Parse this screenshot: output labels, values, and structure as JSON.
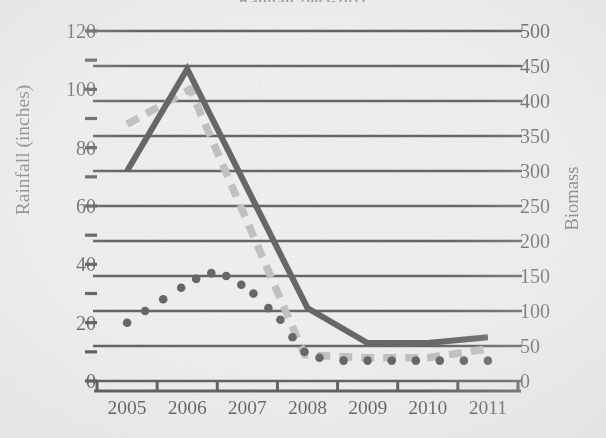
{
  "chart_data": {
    "type": "line",
    "title": "Rainfall 2005-2011",
    "title_visible_fragment": "Rainfall 2005-2011",
    "xlabel": "",
    "ylabel": "Rainfall (inches)",
    "y2label": "Biomass",
    "categories": [
      "2005",
      "2006",
      "2007",
      "2008",
      "2009",
      "2010",
      "2011"
    ],
    "ylim": [
      0,
      120
    ],
    "yticks": [
      "0",
      "20",
      "40",
      "60",
      "80",
      "100",
      "120"
    ],
    "ytick_values": [
      0,
      20,
      40,
      60,
      80,
      100,
      120
    ],
    "y2lim": [
      0,
      500
    ],
    "y2ticks": [
      "0",
      "50",
      "100",
      "150",
      "200",
      "250",
      "300",
      "350",
      "400",
      "450",
      "500"
    ],
    "y2tick_values": [
      0,
      50,
      100,
      150,
      200,
      250,
      300,
      350,
      400,
      450,
      500
    ],
    "grid": true,
    "grid_orientation": "horizontal",
    "legend": "none",
    "series": [
      {
        "name": "solid-black-line",
        "style": "solid",
        "color": "#1a1a1a",
        "axis": "left",
        "values": [
          72,
          107,
          66,
          25,
          13,
          13,
          15
        ]
      },
      {
        "name": "gray-dashed-line",
        "style": "dashed",
        "color": "#a0a0a0",
        "axis": "left",
        "values": [
          88,
          100,
          60,
          9,
          8,
          8,
          11
        ]
      },
      {
        "name": "black-dotted-line",
        "style": "dotted",
        "color": "#1a1a1a",
        "axis": "left",
        "values": [
          20,
          35,
          22,
          8,
          7,
          7,
          7
        ]
      }
    ],
    "series_dense_points": {
      "solid_black": [
        [
          2005.0,
          72
        ],
        [
          2006.0,
          107
        ],
        [
          2008.0,
          25
        ],
        [
          2009.0,
          13
        ],
        [
          2010.0,
          13
        ],
        [
          2011.0,
          15
        ]
      ],
      "gray_dashed": [
        [
          2005.0,
          88
        ],
        [
          2006.05,
          100
        ],
        [
          2007.95,
          9
        ],
        [
          2009.0,
          8
        ],
        [
          2010.0,
          8
        ],
        [
          2011.0,
          11
        ]
      ],
      "black_dotted": [
        [
          2005.0,
          20
        ],
        [
          2005.3,
          24
        ],
        [
          2005.6,
          28
        ],
        [
          2005.9,
          32
        ],
        [
          2006.15,
          35
        ],
        [
          2006.4,
          37
        ],
        [
          2006.65,
          36
        ],
        [
          2006.9,
          33
        ],
        [
          2007.1,
          30
        ],
        [
          2007.35,
          25
        ],
        [
          2007.55,
          21
        ],
        [
          2007.75,
          15
        ],
        [
          2007.95,
          10
        ],
        [
          2008.2,
          8
        ],
        [
          2008.6,
          7
        ],
        [
          2009.0,
          7
        ],
        [
          2009.4,
          7
        ],
        [
          2009.8,
          7
        ],
        [
          2010.2,
          7
        ],
        [
          2010.6,
          7
        ],
        [
          2011.0,
          7
        ]
      ]
    }
  },
  "axis": {
    "left_title": "Rainfall (inches)",
    "right_title": "Biomass"
  }
}
